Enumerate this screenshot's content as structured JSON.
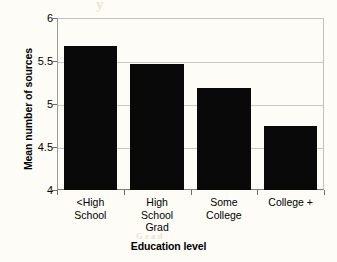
{
  "chart_data": {
    "type": "bar",
    "title": "",
    "xlabel": "Education level",
    "ylabel": "Mean number of sources",
    "categories": [
      "<High\nSchool",
      "High\nSchool\nGrad",
      "Some\nCollege",
      "College +"
    ],
    "values": [
      5.67,
      5.46,
      5.19,
      4.74
    ],
    "ylim": [
      4,
      6
    ],
    "yticks": [
      "4",
      "4.5",
      "5",
      "5.5",
      "6"
    ],
    "ytick_values": [
      4,
      4.5,
      5,
      5.5,
      6
    ],
    "grid": true,
    "legend": false,
    "bar_color": "#090909",
    "background_color": "#fdfcf7",
    "gridline_color": "#c9c8c0",
    "axis_color": "#7d7d76"
  },
  "artifacts": {
    "top": "y",
    "left": "ent",
    "right": "tion",
    "bottom": "Grad"
  }
}
